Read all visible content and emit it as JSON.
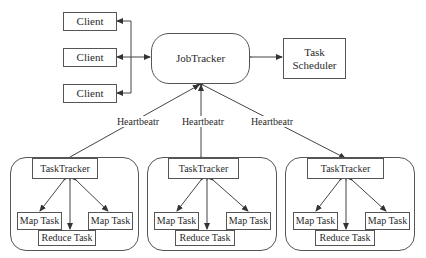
{
  "clients": [
    {
      "label": "Client"
    },
    {
      "label": "Client"
    },
    {
      "label": "Client"
    }
  ],
  "job_tracker": {
    "label": "JobTracker"
  },
  "task_scheduler": {
    "line1": "Task",
    "line2": "Scheduler"
  },
  "heartbeat_labels": [
    "Heartbeatr",
    "Heartbeatr",
    "Heartbeatr"
  ],
  "clusters": [
    {
      "task_tracker": "TaskTracker",
      "map_task_left": "Map Task",
      "map_task_right": "Map Task",
      "reduce_task": "Reduce Task"
    },
    {
      "task_tracker": "TaskTracker",
      "map_task_left": "Map Task",
      "map_task_right": "Map Task",
      "reduce_task": "Reduce Task"
    },
    {
      "task_tracker": "TaskTracker",
      "map_task_left": "Map Task",
      "map_task_right": "Map Task",
      "reduce_task": "Reduce Task"
    }
  ],
  "colors": {
    "stroke": "#555555",
    "text": "#2a2a2a",
    "background": "#ffffff"
  }
}
